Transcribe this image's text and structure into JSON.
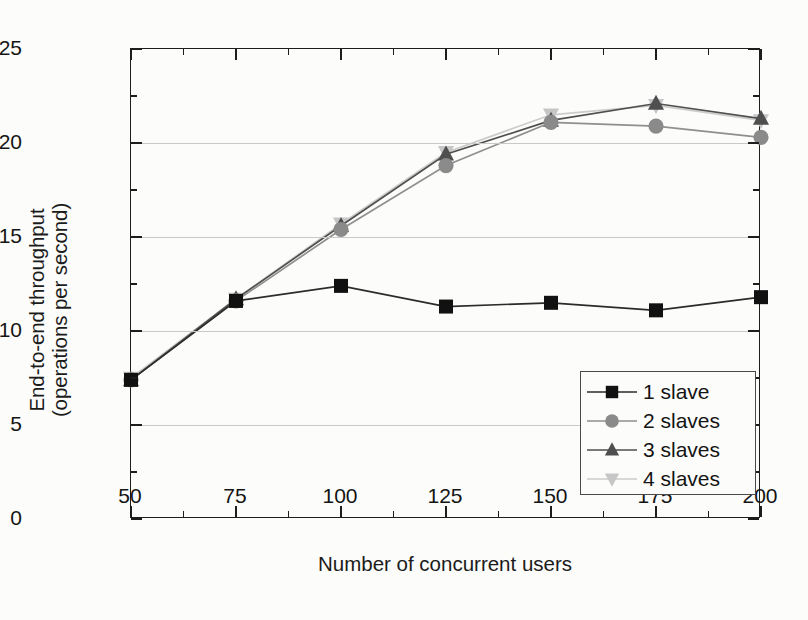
{
  "chart_data": {
    "type": "line",
    "title": "",
    "xlabel": "Number of concurrent users",
    "ylabel": "End-to-end throughput (operations per second)",
    "ylabel_line1": "End-to-end throughput",
    "ylabel_line2": "(operations per second)",
    "x": [
      50,
      75,
      100,
      125,
      150,
      175,
      200
    ],
    "xlim": [
      50,
      200
    ],
    "ylim": [
      0,
      25
    ],
    "xticks": [
      "50",
      "75",
      "100",
      "125",
      "150",
      "175",
      "200"
    ],
    "yticks": [
      "0",
      "5",
      "10",
      "15",
      "20",
      "25"
    ],
    "x_minor_step": 12.5,
    "y_minor_step": 2.5,
    "grid": "horizontal-major",
    "legend_position": "lower-right-inside",
    "series": [
      {
        "name": "1 slave",
        "marker": "square",
        "color": "#111111",
        "line_color": "#2b2b2b",
        "values": [
          7.4,
          11.6,
          12.4,
          11.3,
          11.5,
          11.1,
          11.8
        ]
      },
      {
        "name": "2 slaves",
        "marker": "circle",
        "color": "#8a8a8a",
        "line_color": "#8f8f8f",
        "values": [
          7.4,
          11.6,
          15.4,
          18.8,
          21.1,
          20.9,
          20.3
        ]
      },
      {
        "name": "3 slaves",
        "marker": "triangle-up",
        "color": "#4f4f4f",
        "line_color": "#4f4f4f",
        "values": [
          7.4,
          11.7,
          15.6,
          19.4,
          21.2,
          22.1,
          21.3
        ]
      },
      {
        "name": "4 slaves",
        "marker": "triangle-down",
        "color": "#c6c6c6",
        "line_color": "#cccccc",
        "values": [
          7.5,
          11.7,
          15.7,
          19.5,
          21.5,
          22.0,
          21.2
        ]
      }
    ]
  }
}
